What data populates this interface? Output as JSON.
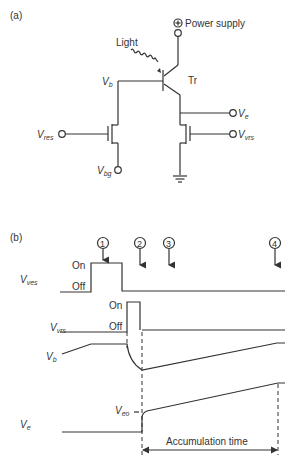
{
  "panel_a": {
    "label": "(a)",
    "power_supply": {
      "symbol": "⊕",
      "label": "Power supply"
    },
    "light_label": "Light",
    "transistor_label": "Tr",
    "nodes": {
      "vb": {
        "main": "V",
        "sub": "b"
      },
      "ve": {
        "main": "V",
        "sub": "e"
      },
      "vres": {
        "main": "V",
        "sub": "res"
      },
      "vvrs": {
        "main": "V",
        "sub": "vrs"
      },
      "vbg": {
        "main": "V",
        "sub": "bg"
      }
    },
    "icons": [
      "power-supply-terminal-icon",
      "phototransistor-icon",
      "light-wave-icon",
      "mosfet-reset-icon",
      "mosfet-vrs-icon",
      "ground-icon"
    ]
  },
  "panel_b": {
    "label": "(b)",
    "markers": [
      "1",
      "2",
      "3",
      "4"
    ],
    "signals": {
      "vves": {
        "main": "V",
        "sub": "ves",
        "on": "On",
        "off": "Off"
      },
      "vvrs": {
        "main": "V",
        "sub": "vrs",
        "on": "On",
        "off": "Off"
      },
      "vb": {
        "main": "V",
        "sub": "b"
      },
      "ve": {
        "main": "V",
        "sub": "e"
      },
      "veo": {
        "main": "V",
        "sub": "eo"
      }
    },
    "accumulation_label": "Accumulation time"
  },
  "colors": {
    "line": "#333333",
    "background": "#ffffff"
  }
}
